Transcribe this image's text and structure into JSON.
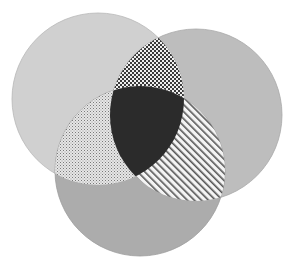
{
  "diagram": {
    "type": "venn",
    "sets": [
      {
        "id": "A",
        "position": "top-left",
        "cx": 98,
        "cy": 99,
        "r": 86,
        "fill": "#d0d0d0"
      },
      {
        "id": "B",
        "position": "right",
        "cx": 196,
        "cy": 115,
        "r": 86,
        "fill": "#bdbdbd"
      },
      {
        "id": "C",
        "position": "bottom",
        "cx": 140,
        "cy": 171,
        "r": 85,
        "fill": "#acacac"
      }
    ],
    "intersections": [
      {
        "sets": [
          "A",
          "B"
        ],
        "pattern": "crosshatch-checker"
      },
      {
        "sets": [
          "A",
          "C"
        ],
        "pattern": "fine-dots"
      },
      {
        "sets": [
          "B",
          "C"
        ],
        "pattern": "diagonal-stripes"
      },
      {
        "sets": [
          "A",
          "B",
          "C"
        ],
        "pattern": "solid",
        "fill": "#2b2b2b"
      }
    ],
    "outline_color": "#a8a8a8",
    "pattern_ink": "#3a3a3a",
    "pattern_paper": "#f2f2f2"
  }
}
